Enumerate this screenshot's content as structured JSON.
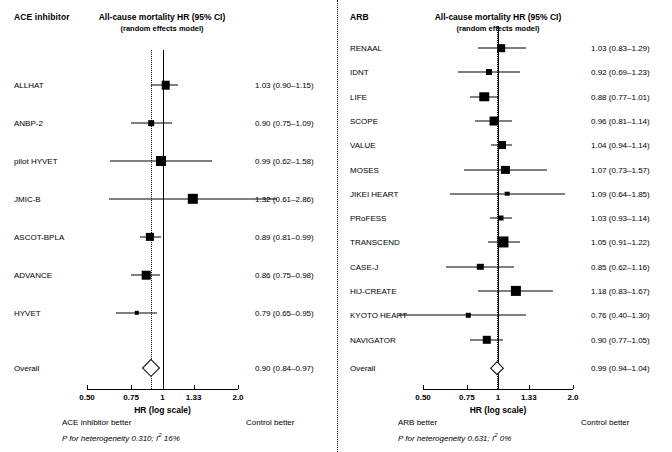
{
  "figure": {
    "width": 672,
    "height": 452,
    "background": "#ffffff",
    "foreground": "#000000"
  },
  "chart_data": {
    "type": "forest",
    "panels": [
      {
        "id": "ace-inhibitor",
        "group_header": "ACE inhibitor",
        "measure_header_line1": "All-cause mortality HR (95% CI)",
        "measure_header_line2": "(random effects model)",
        "axis": {
          "scale": "log",
          "title": "HR (log scale)",
          "ticks": [
            0.5,
            0.75,
            1,
            1.33,
            2.0
          ],
          "tick_labels": [
            "0.50",
            "0.75",
            "1",
            "1.33",
            "2.0"
          ],
          "xlim": [
            0.5,
            2.0
          ],
          "null_value": 1
        },
        "left_favor_label": "ACE inhibitor better",
        "right_favor_label": "Control better",
        "heterogeneity": "P for heterogeneity 0.310; I² 16%",
        "heterogeneity_p": "0.310",
        "heterogeneity_i2": "16%",
        "pooled_line_value": 0.9,
        "rows": [
          {
            "label": "ALLHAT",
            "hr": 1.03,
            "lo": 0.9,
            "hi": 1.15,
            "text": "1.03 (0.90–1.15)",
            "weight": 0.62
          },
          {
            "label": "ANBP-2",
            "hr": 0.9,
            "lo": 0.75,
            "hi": 1.09,
            "text": "0.90 (0.75–1.09)",
            "weight": 0.3
          },
          {
            "label": "pilot HYVET",
            "hr": 0.99,
            "lo": 0.62,
            "hi": 1.58,
            "text": "0.99 (0.62–1.58)",
            "weight": 0.78
          },
          {
            "label": "JMIC-B",
            "hr": 1.32,
            "lo": 0.61,
            "hi": 2.86,
            "text": "1.32 (0.61–2.86)",
            "weight": 0.82
          },
          {
            "label": "ASCOT-BPLA",
            "hr": 0.89,
            "lo": 0.81,
            "hi": 0.99,
            "text": "0.89 (0.81–0.99)",
            "weight": 0.58
          },
          {
            "label": "ADVANCE",
            "hr": 0.86,
            "lo": 0.75,
            "hi": 0.98,
            "text": "0.86 (0.75–0.98)",
            "weight": 0.62
          },
          {
            "label": "HYVET",
            "hr": 0.79,
            "lo": 0.65,
            "hi": 0.95,
            "text": "0.79 (0.65–0.95)",
            "weight": 0.16
          }
        ],
        "overall": {
          "label": "Overall",
          "hr": 0.9,
          "lo": 0.84,
          "hi": 0.97,
          "text": "0.90 (0.84–0.97)"
        }
      },
      {
        "id": "arb",
        "group_header": "ARB",
        "measure_header_line1": "All-cause mortality HR (95% CI)",
        "measure_header_line2": "(random effects model)",
        "axis": {
          "scale": "log",
          "title": "HR (log scale)",
          "ticks": [
            0.5,
            0.75,
            1,
            1.33,
            2.0
          ],
          "tick_labels": [
            "0.50",
            "0.75",
            "1",
            "1.33",
            "2.0"
          ],
          "xlim": [
            0.5,
            2.0
          ],
          "null_value": 1
        },
        "left_favor_label": "ARB better",
        "right_favor_label": "Control better",
        "heterogeneity": "P for heterogeneity 0.631; I² 0%",
        "heterogeneity_p": "0.631",
        "heterogeneity_i2": "0%",
        "pooled_line_value": 0.99,
        "rows": [
          {
            "label": "RENAAL",
            "hr": 1.03,
            "lo": 0.83,
            "hi": 1.29,
            "text": "1.03 (0.83–1.29)",
            "weight": 0.52
          },
          {
            "label": "IDNT",
            "hr": 0.92,
            "lo": 0.69,
            "hi": 1.23,
            "text": "0.92 (0.69–1.23)",
            "weight": 0.33
          },
          {
            "label": "LIFE",
            "hr": 0.88,
            "lo": 0.77,
            "hi": 1.01,
            "text": "0.88 (0.77–1.01)",
            "weight": 0.72
          },
          {
            "label": "SCOPE",
            "hr": 0.96,
            "lo": 0.81,
            "hi": 1.14,
            "text": "0.96 (0.81–1.14)",
            "weight": 0.66
          },
          {
            "label": "VALUE",
            "hr": 1.04,
            "lo": 0.94,
            "hi": 1.14,
            "text": "1.04 (0.94–1.14)",
            "weight": 0.56
          },
          {
            "label": "MOSES",
            "hr": 1.07,
            "lo": 0.73,
            "hi": 1.57,
            "text": "1.07 (0.73–1.57)",
            "weight": 0.58
          },
          {
            "label": "JIKEI HEART",
            "hr": 1.09,
            "lo": 0.64,
            "hi": 1.85,
            "text": "1.09 (0.64–1.85)",
            "weight": 0.18
          },
          {
            "label": "PRoFESS",
            "hr": 1.03,
            "lo": 0.93,
            "hi": 1.14,
            "text": "1.03 (0.93–1.14)",
            "weight": 0.22
          },
          {
            "label": "TRANSCEND",
            "hr": 1.05,
            "lo": 0.91,
            "hi": 1.22,
            "text": "1.05 (0.91–1.22)",
            "weight": 0.9
          },
          {
            "label": "CASE-J",
            "hr": 0.85,
            "lo": 0.62,
            "hi": 1.16,
            "text": "0.85 (0.62–1.16)",
            "weight": 0.38
          },
          {
            "label": "HIJ-CREATE",
            "hr": 1.18,
            "lo": 0.83,
            "hi": 1.67,
            "text": "1.18 (0.83–1.67)",
            "weight": 0.8
          },
          {
            "label": "KYOTO HEART",
            "hr": 0.76,
            "lo": 0.4,
            "hi": 1.3,
            "text": "0.76 (0.40–1.30)",
            "weight": 0.16
          },
          {
            "label": "NAVIGATOR",
            "hr": 0.9,
            "lo": 0.77,
            "hi": 1.05,
            "text": "0.90 (0.77–1.05)",
            "weight": 0.6
          }
        ],
        "overall": {
          "label": "Overall",
          "hr": 0.99,
          "lo": 0.94,
          "hi": 1.04,
          "text": "0.99 (0.94–1.04)"
        }
      }
    ]
  }
}
